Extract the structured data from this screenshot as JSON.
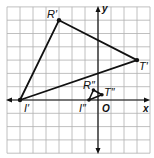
{
  "diagram": {
    "type": "coordinate-plane-dilation",
    "grid": {
      "x_min": -7,
      "x_max": 4,
      "y_min": -4,
      "y_max": 7,
      "line_color": "#b0b0b0",
      "axis_color": "#111111"
    },
    "axes": {
      "x_label": "x",
      "y_label": "y",
      "origin_label": "O"
    },
    "triangles": [
      {
        "name": "I'R'T'",
        "color": "#111111",
        "vertices": [
          {
            "label": "I'",
            "x": -6,
            "y": 0
          },
          {
            "label": "R'",
            "x": -3,
            "y": 6
          },
          {
            "label": "T'",
            "x": 3,
            "y": 3
          }
        ]
      },
      {
        "name": "I''R''T''",
        "color": "#111111",
        "vertices": [
          {
            "label": "I''",
            "x": -0.7,
            "y": 0
          },
          {
            "label": "R''",
            "x": -0.35,
            "y": 0.75
          },
          {
            "label": "T''",
            "x": 0.3,
            "y": 0.4
          }
        ]
      }
    ]
  },
  "labels": {
    "i_prime": "I′",
    "r_prime": "R′",
    "t_prime": "T′",
    "i_dprime": "I″",
    "r_dprime": "R″",
    "t_dprime": "T″",
    "x": "x",
    "y": "y",
    "o": "O"
  }
}
